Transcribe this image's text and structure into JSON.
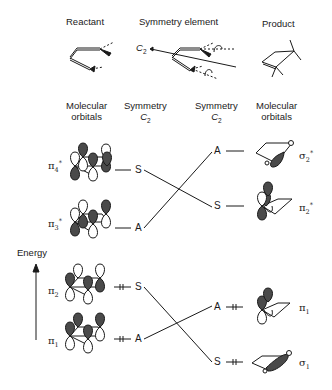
{
  "headers": {
    "reactant": "Reactant",
    "symmetry_element": "Symmetry element",
    "product": "Product",
    "c2_axis_label": "C",
    "c2_axis_sub": "2"
  },
  "columns": {
    "left_orbitals_line1": "Molecular",
    "left_orbitals_line2": "orbitals",
    "left_symmetry_line1": "Symmetry",
    "left_symmetry_line2": "C",
    "left_symmetry_sub": "2",
    "right_symmetry_line1": "Symmetry",
    "right_symmetry_line2": "C",
    "right_symmetry_sub": "2",
    "right_orbitals_line1": "Molecular",
    "right_orbitals_line2": "orbitals"
  },
  "axis": {
    "label": "Energy"
  },
  "reactant_orbitals": [
    {
      "symbol": "π",
      "sub": "4",
      "sup": "*",
      "symmetry": "S",
      "occupied": false
    },
    {
      "symbol": "π",
      "sub": "3",
      "sup": "*",
      "symmetry": "A",
      "occupied": false
    },
    {
      "symbol": "π",
      "sub": "2",
      "sup": "",
      "symmetry": "S",
      "occupied": true
    },
    {
      "symbol": "π",
      "sub": "1",
      "sup": "",
      "symmetry": "A",
      "occupied": true
    }
  ],
  "product_orbitals": [
    {
      "symbol": "σ",
      "sub": "2",
      "sup": "*",
      "symmetry": "A",
      "occupied": false
    },
    {
      "symbol": "π",
      "sub": "2",
      "sup": "*",
      "symmetry": "S",
      "occupied": false
    },
    {
      "symbol": "π",
      "sub": "1",
      "sup": "",
      "symmetry": "A",
      "occupied": true
    },
    {
      "symbol": "σ",
      "sub": "1",
      "sup": "",
      "symmetry": "S",
      "occupied": true
    }
  ],
  "correlations": [
    {
      "from": "π4*",
      "to": "π2*",
      "symmetry": "S"
    },
    {
      "from": "π3*",
      "to": "σ2*",
      "symmetry": "A"
    },
    {
      "from": "π2",
      "to": "σ1",
      "symmetry": "S"
    },
    {
      "from": "π1",
      "to": "π1",
      "symmetry": "A"
    }
  ],
  "colors": {
    "ink": "#1a1a1a",
    "lobe_fill": "#4a4a4a",
    "background": "#ffffff"
  }
}
